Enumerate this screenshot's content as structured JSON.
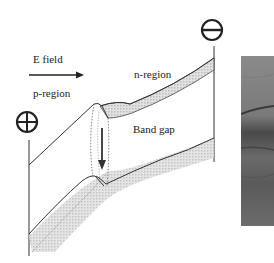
{
  "labels": {
    "e_field": "E field",
    "p_region": "p-region",
    "n_region": "n-region",
    "band_gap": "Band gap"
  },
  "symbols": {
    "positive_terminal": "+",
    "negative_terminal": "−"
  },
  "colors": {
    "line": "#333333",
    "band_fill": "#c8c8c8",
    "photo": "#6f6f6f"
  }
}
